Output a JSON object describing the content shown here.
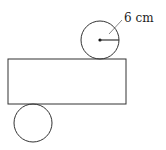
{
  "diagram": {
    "radius_label": "6 cm",
    "shapes": {
      "top_circle": {
        "cx": 100,
        "cy": 40,
        "r": 19
      },
      "rectangle": {
        "x": 8,
        "y": 59,
        "width": 118,
        "height": 45
      },
      "bottom_circle": {
        "cx": 33,
        "cy": 123,
        "r": 19
      }
    },
    "stroke_color": "#333333"
  }
}
